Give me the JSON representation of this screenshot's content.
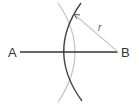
{
  "diagram": {
    "point_a_label": "A",
    "point_b_label": "B",
    "radius_label": "r",
    "colors": {
      "segment": "#333333",
      "dark_arc": "#444444",
      "light_arc": "#c4c4c4",
      "radius_line": "#c8c8c8"
    }
  }
}
